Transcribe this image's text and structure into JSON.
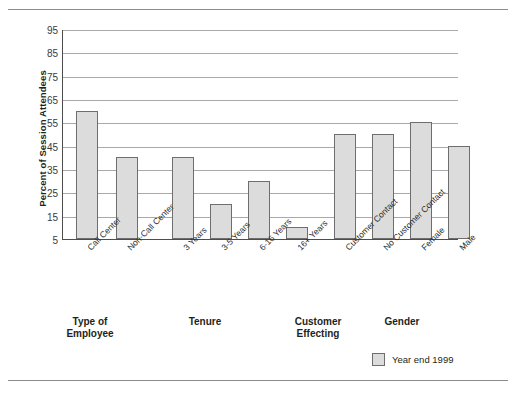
{
  "chart_data": {
    "type": "bar",
    "title": "",
    "xlabel": "",
    "ylabel": "Percent of Session Attendees",
    "ylim": [
      5,
      95
    ],
    "ytick_step": 10,
    "yticks": [
      95,
      85,
      75,
      65,
      55,
      45,
      35,
      25,
      15,
      5
    ],
    "grid": true,
    "legend_position": "bottom-right",
    "legend": [
      "Year end 1999"
    ],
    "series": [
      {
        "name": "Year end 1999",
        "color": "#dcdcdc",
        "values": [
          60,
          40,
          40,
          20,
          30,
          10,
          50,
          50,
          55,
          45
        ]
      }
    ],
    "categories": [
      "Call Center",
      "Non-Call Center",
      "3 Years",
      "3-5 Years",
      "6-16 Years",
      "16+ Years",
      "Customer Contact",
      "No Customer Contact",
      "Female",
      "Male"
    ],
    "groups": [
      {
        "label_line1": "Type of",
        "label_line2": "Employee",
        "categories": [
          "Call Center",
          "Non-Call Center"
        ]
      },
      {
        "label_line1": "Tenure",
        "label_line2": "",
        "categories": [
          "3 Years",
          "3-5 Years",
          "6-16 Years",
          "16+ Years"
        ]
      },
      {
        "label_line1": "Customer",
        "label_line2": "Effecting",
        "categories": [
          "Customer Contact",
          "No Customer Contact"
        ]
      },
      {
        "label_line1": "Gender",
        "label_line2": "",
        "categories": [
          "Female",
          "Male"
        ]
      }
    ]
  },
  "colors": {
    "bar_fill": "#dcdcdc",
    "bar_border": "#6e6e6e",
    "gridline": "#a9a9a9",
    "axis": "#4d4d4d",
    "text": "#231f20"
  }
}
